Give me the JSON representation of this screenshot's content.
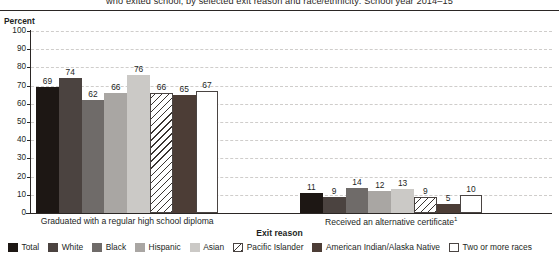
{
  "title": "who exited school, by selected exit reason and race/ethnicity: School year 2014–15",
  "y_axis_label": "Percent",
  "x_axis_title": "Exit reason",
  "footnote_marker": "1",
  "chart_data": {
    "type": "bar",
    "title": "who exited school, by selected exit reason and race/ethnicity: School year 2014–15",
    "xlabel": "Exit reason",
    "ylabel": "Percent",
    "ylim": [
      0,
      100
    ],
    "ytick_labels": [
      "0",
      "10",
      "20",
      "30",
      "40",
      "50",
      "60",
      "70",
      "80",
      "90",
      "100"
    ],
    "ytick_values": [
      0,
      10,
      20,
      30,
      40,
      50,
      60,
      70,
      80,
      90,
      100
    ],
    "grid": true,
    "legend_position": "bottom",
    "categories": [
      "Graduated with a regular high school diploma",
      "Received an alternative certificate"
    ],
    "series": [
      {
        "name": "Total",
        "color": "#1d1714",
        "fill": "solid",
        "values": [
          69,
          11
        ]
      },
      {
        "name": "White",
        "color": "#4b4340",
        "fill": "solid",
        "values": [
          74,
          9
        ]
      },
      {
        "name": "Black",
        "color": "#6f6b69",
        "fill": "solid",
        "values": [
          62,
          14
        ]
      },
      {
        "name": "Hispanic",
        "color": "#a9a6a3",
        "fill": "solid",
        "values": [
          66,
          12
        ]
      },
      {
        "name": "Asian",
        "color": "#cbc9c6",
        "fill": "solid",
        "values": [
          76,
          13
        ]
      },
      {
        "name": "Pacific Islander",
        "color": "#ffffff",
        "fill": "diagonal-hatch",
        "values": [
          66,
          9
        ]
      },
      {
        "name": "American Indian/Alaska Native",
        "color": "#4c3d36",
        "fill": "solid",
        "values": [
          65,
          5
        ]
      },
      {
        "name": "Two or more races",
        "color": "#ffffff",
        "fill": "outline",
        "values": [
          67,
          10
        ]
      }
    ]
  },
  "legend": {
    "items": [
      {
        "label": "Total"
      },
      {
        "label": "White"
      },
      {
        "label": "Black"
      },
      {
        "label": "Hispanic"
      },
      {
        "label": "Asian"
      },
      {
        "label": "Pacific Islander"
      },
      {
        "label": "American Indian/Alaska Native"
      },
      {
        "label": "Two or more races"
      }
    ]
  }
}
